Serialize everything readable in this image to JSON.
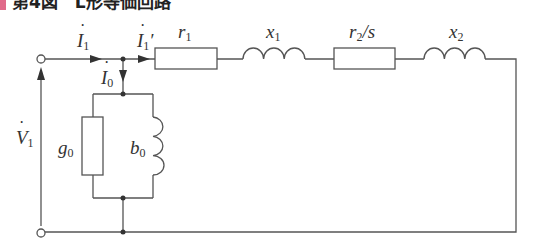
{
  "title": {
    "text": "第4図　L形等価回路",
    "accent_color": "#e06a8a",
    "note": "cropped at top edge"
  },
  "circuit": {
    "name": "L-type equivalent circuit",
    "labels": {
      "I1": {
        "sym": "I",
        "sub": "1",
        "prime": ""
      },
      "I1p": {
        "sym": "I",
        "sub": "1",
        "prime": "′"
      },
      "I0": {
        "sym": "I",
        "sub": "0",
        "prime": ""
      },
      "V1": {
        "sym": "V",
        "sub": "1",
        "prime": ""
      },
      "r1": {
        "sym": "r",
        "sub": "1"
      },
      "x1": {
        "sym": "x",
        "sub": "1"
      },
      "r2s": {
        "sym": "r",
        "sub": "2",
        "suffix": "/s"
      },
      "x2": {
        "sym": "x",
        "sub": "2"
      },
      "g0": {
        "sym": "g",
        "sub": "0"
      },
      "b0": {
        "sym": "b",
        "sub": "0"
      }
    },
    "components": [
      {
        "id": "r1",
        "type": "resistor",
        "position": "series"
      },
      {
        "id": "x1",
        "type": "inductor",
        "position": "series"
      },
      {
        "id": "r2s",
        "type": "resistor",
        "position": "series"
      },
      {
        "id": "x2",
        "type": "inductor",
        "position": "series"
      },
      {
        "id": "g0",
        "type": "resistor",
        "position": "shunt"
      },
      {
        "id": "b0",
        "type": "inductor",
        "position": "shunt"
      }
    ],
    "line_color": "#555555"
  }
}
